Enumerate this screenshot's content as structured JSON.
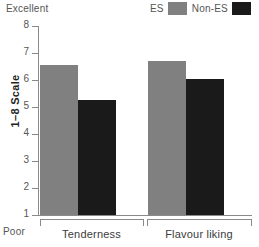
{
  "chart_data": {
    "type": "bar",
    "title": "",
    "subtitle": "",
    "xlabel": "",
    "ylabel": "1–8 Scale",
    "ylim": [
      1,
      8
    ],
    "yticks": [
      1,
      2,
      3,
      4,
      5,
      6,
      7,
      8
    ],
    "ytick_labels": [
      "1",
      "2",
      "3",
      "4",
      "5",
      "6",
      "7",
      "8"
    ],
    "grid": false,
    "legend_position": "top-right",
    "categories": [
      "Tenderness",
      "Flavour liking"
    ],
    "series": [
      {
        "name": "ES",
        "color": "#808080",
        "values": [
          6.55,
          6.7
        ]
      },
      {
        "name": "Non-ES",
        "color": "#1a1a1a",
        "values": [
          5.25,
          6.05
        ]
      }
    ],
    "annotations": [
      {
        "name": "scale-top",
        "text": "Excellent",
        "position": "top-left"
      },
      {
        "name": "scale-bottom",
        "text": "Poor",
        "position": "bottom-left"
      }
    ]
  },
  "legend": {
    "entries": [
      {
        "label": "ES",
        "color": "#808080"
      },
      {
        "label": "Non-ES",
        "color": "#1a1a1a"
      }
    ]
  },
  "axes": {
    "y_title": "1–8 Scale",
    "tick_labels": [
      "8",
      "7",
      "6",
      "5",
      "4",
      "3",
      "2",
      "1"
    ],
    "category_labels": [
      "Tenderness",
      "Flavour liking"
    ]
  },
  "annotations": {
    "excellent": "Excellent",
    "poor": "Poor"
  }
}
